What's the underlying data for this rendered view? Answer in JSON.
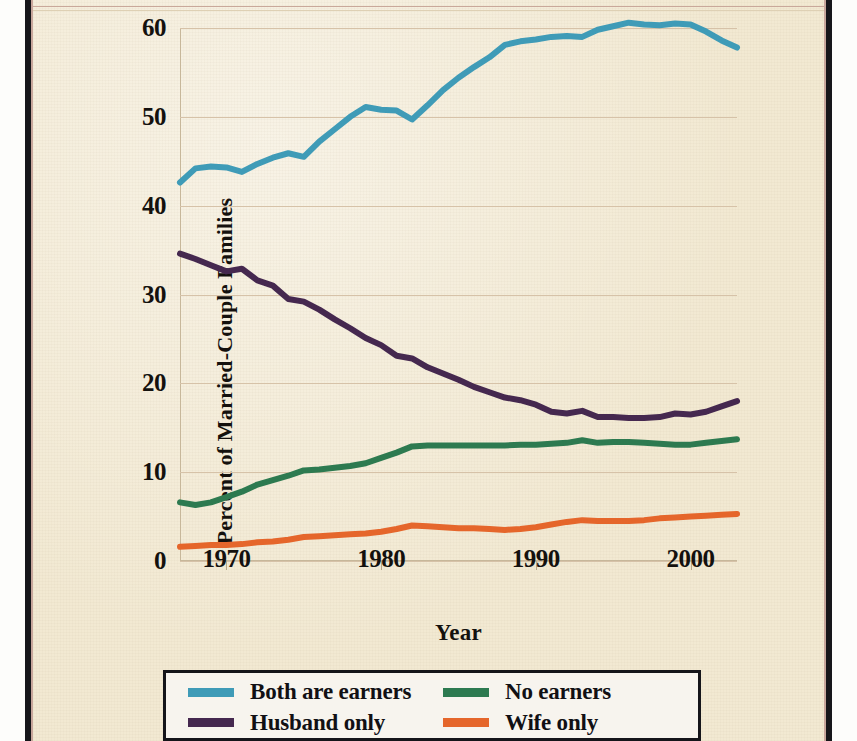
{
  "figure": {
    "background_color": "#f2e9d2",
    "frame_color": "#16161a",
    "rule_color": "#c9a89a"
  },
  "chart_data": {
    "type": "line",
    "title": "",
    "xlabel": "Year",
    "ylabel": "Percent of Married-Couple Families",
    "xlim": [
      1967,
      2003
    ],
    "ylim": [
      0,
      60
    ],
    "xticks": [
      1970,
      1980,
      1990,
      2000
    ],
    "yticks": [
      0,
      10,
      20,
      30,
      40,
      50,
      60
    ],
    "grid": true,
    "legend_position": "bottom",
    "x": [
      1967,
      1968,
      1969,
      1970,
      1971,
      1972,
      1973,
      1974,
      1975,
      1976,
      1977,
      1978,
      1979,
      1980,
      1981,
      1982,
      1983,
      1984,
      1985,
      1986,
      1987,
      1988,
      1989,
      1990,
      1991,
      1992,
      1993,
      1994,
      1995,
      1996,
      1997,
      1998,
      1999,
      2000,
      2001,
      2002,
      2003
    ],
    "series": [
      {
        "name": "Both are earners",
        "color": "#3f9bb7",
        "values": [
          42.6,
          44.2,
          44.4,
          44.3,
          43.8,
          44.7,
          45.4,
          45.9,
          45.5,
          47.2,
          48.6,
          50.0,
          51.1,
          50.8,
          50.7,
          49.7,
          51.3,
          53.0,
          54.4,
          55.6,
          56.7,
          58.1,
          58.5,
          58.7,
          59.0,
          59.1,
          59.0,
          59.8,
          60.2,
          60.6,
          60.4,
          60.3,
          60.5,
          60.4,
          59.6,
          58.6,
          57.8
        ]
      },
      {
        "name": "Husband only",
        "color": "#45284f",
        "values": [
          34.6,
          34.0,
          33.3,
          32.6,
          32.9,
          31.6,
          31.0,
          29.5,
          29.2,
          28.3,
          27.2,
          26.2,
          25.1,
          24.3,
          23.1,
          22.8,
          21.8,
          21.1,
          20.4,
          19.6,
          19.0,
          18.4,
          18.1,
          17.6,
          16.8,
          16.6,
          16.9,
          16.2,
          16.2,
          16.1,
          16.1,
          16.2,
          16.6,
          16.5,
          16.8,
          17.4,
          18.0
        ]
      },
      {
        "name": "No earners",
        "color": "#2d7a50",
        "values": [
          6.6,
          6.3,
          6.6,
          7.2,
          7.8,
          8.6,
          9.1,
          9.6,
          10.2,
          10.3,
          10.5,
          10.7,
          11.0,
          11.6,
          12.2,
          12.9,
          13.0,
          13.0,
          13.0,
          13.0,
          13.0,
          13.0,
          13.1,
          13.1,
          13.2,
          13.3,
          13.6,
          13.3,
          13.4,
          13.4,
          13.3,
          13.2,
          13.1,
          13.1,
          13.3,
          13.5,
          13.7
        ]
      },
      {
        "name": "Wife only",
        "color": "#e5662b",
        "values": [
          1.6,
          1.7,
          1.8,
          1.8,
          1.9,
          2.1,
          2.2,
          2.4,
          2.7,
          2.8,
          2.9,
          3.0,
          3.1,
          3.3,
          3.6,
          4.0,
          3.9,
          3.8,
          3.7,
          3.7,
          3.6,
          3.5,
          3.6,
          3.8,
          4.1,
          4.4,
          4.6,
          4.5,
          4.5,
          4.5,
          4.6,
          4.8,
          4.9,
          5.0,
          5.1,
          5.2,
          5.3
        ]
      }
    ]
  },
  "axes": {
    "y_tick_labels": [
      "60",
      "50",
      "40",
      "30",
      "20",
      "10",
      "0"
    ],
    "x_tick_labels": [
      "1970",
      "1980",
      "1990",
      "2000"
    ],
    "y_title": "Percent of Married-Couple Families",
    "x_title": "Year"
  },
  "legend": {
    "items": [
      {
        "label": "Both are earners",
        "color": "#3f9bb7"
      },
      {
        "label": "No earners",
        "color": "#2d7a50"
      },
      {
        "label": "Husband only",
        "color": "#45284f"
      },
      {
        "label": "Wife only",
        "color": "#e5662b"
      }
    ]
  }
}
